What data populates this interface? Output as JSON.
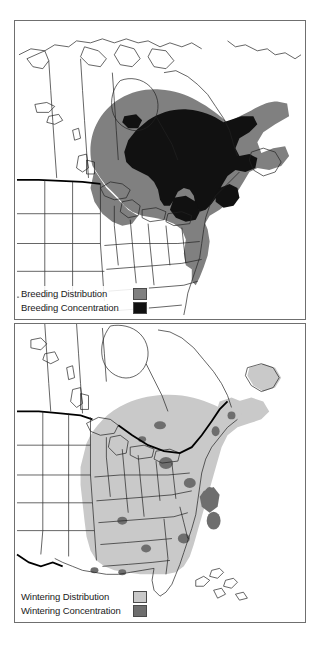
{
  "figure": {
    "panel_count": 2,
    "background_color": "#ffffff",
    "frame_color": "#6f6f6f"
  },
  "palette": {
    "breeding_distribution": "#808080",
    "breeding_concentration": "#111111",
    "wintering_distribution": "#c9c9c9",
    "wintering_concentration": "#6e6e6e",
    "land_fill": "#ffffff",
    "border_line": "#222222",
    "international_border": "#000000"
  },
  "panels": [
    {
      "id": "breeding",
      "name": "breeding-range-map",
      "region": "North America",
      "legend": {
        "name": "breeding-legend",
        "items": [
          {
            "label": "Breeding Distribution",
            "swatch_color": "#808080",
            "icon": "legend-swatch-icon"
          },
          {
            "label": "Breeding Concentration",
            "swatch_color": "#111111",
            "icon": "legend-swatch-icon"
          }
        ]
      }
    },
    {
      "id": "wintering",
      "name": "wintering-range-map",
      "region": "Eastern United States",
      "legend": {
        "name": "wintering-legend",
        "items": [
          {
            "label": "Wintering Distribution",
            "swatch_color": "#c9c9c9",
            "icon": "legend-swatch-icon"
          },
          {
            "label": "Wintering Concentration",
            "swatch_color": "#6e6e6e",
            "icon": "legend-swatch-icon"
          }
        ]
      }
    }
  ]
}
